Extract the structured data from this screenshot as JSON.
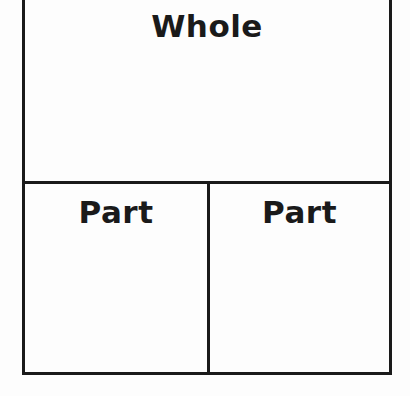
{
  "diagram": {
    "type": "part-part-whole",
    "whole": {
      "label": "Whole"
    },
    "parts": [
      {
        "label": "Part"
      },
      {
        "label": "Part"
      }
    ]
  }
}
